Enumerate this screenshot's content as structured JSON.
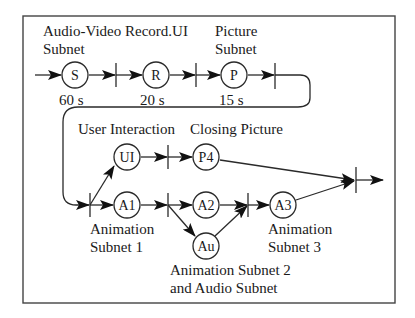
{
  "labels": {
    "av_subnet_1": "Audio-Video Record.UI",
    "av_subnet_2": "Subnet",
    "picture_subnet_1": "Picture",
    "picture_subnet_2": "Subnet",
    "user_interaction": "User Interaction",
    "closing_picture": "Closing Picture",
    "anim_subnet1_1": "Animation",
    "anim_subnet1_2": "Subnet 1",
    "anim_subnet3_1": "Animation",
    "anim_subnet3_2": "Subnet 3",
    "anim_subnet2_1": "Animation Subnet 2",
    "anim_subnet2_2": "and Audio Subnet"
  },
  "nodes": {
    "S": {
      "label": "S",
      "duration": "60 s"
    },
    "R": {
      "label": "R",
      "duration": "20 s"
    },
    "P": {
      "label": "P",
      "duration": "15 s"
    },
    "UI": {
      "label": "UI"
    },
    "P4": {
      "label": "P4"
    },
    "A1": {
      "label": "A1"
    },
    "A2": {
      "label": "A2"
    },
    "Au": {
      "label": "Au"
    },
    "A3": {
      "label": "A3"
    }
  }
}
